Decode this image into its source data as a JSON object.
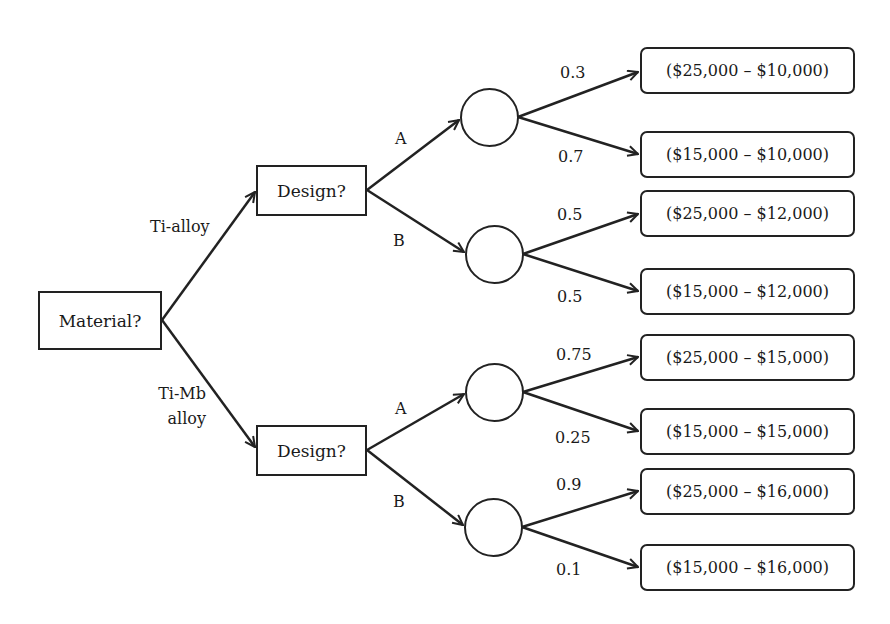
{
  "root": {
    "label": "Material?"
  },
  "material_branches": [
    {
      "label": "Ti-alloy"
    },
    {
      "label_line1": "Ti-Mb",
      "label_line2": "alloy"
    }
  ],
  "decisions": [
    {
      "label": "Design?",
      "branches": [
        {
          "label": "A"
        },
        {
          "label": "B"
        }
      ]
    },
    {
      "label": "Design?",
      "branches": [
        {
          "label": "A"
        },
        {
          "label": "B"
        }
      ]
    }
  ],
  "chance_nodes": [
    {
      "outcomes": [
        {
          "prob": "0.3",
          "payoff": "($25,000 – $10,000)"
        },
        {
          "prob": "0.7",
          "payoff": "($15,000 – $10,000)"
        }
      ]
    },
    {
      "outcomes": [
        {
          "prob": "0.5",
          "payoff": "($25,000 – $12,000)"
        },
        {
          "prob": "0.5",
          "payoff": "($15,000 – $12,000)"
        }
      ]
    },
    {
      "outcomes": [
        {
          "prob": "0.75",
          "payoff": "($25,000 – $15,000)"
        },
        {
          "prob": "0.25",
          "payoff": "($15,000 – $15,000)"
        }
      ]
    },
    {
      "outcomes": [
        {
          "prob": "0.9",
          "payoff": "($25,000 – $16,000)"
        },
        {
          "prob": "0.1",
          "payoff": "($15,000 – $16,000)"
        }
      ]
    }
  ],
  "colors": {
    "stroke": "#222222",
    "background": "#ffffff",
    "text": "#1a1a1a"
  }
}
